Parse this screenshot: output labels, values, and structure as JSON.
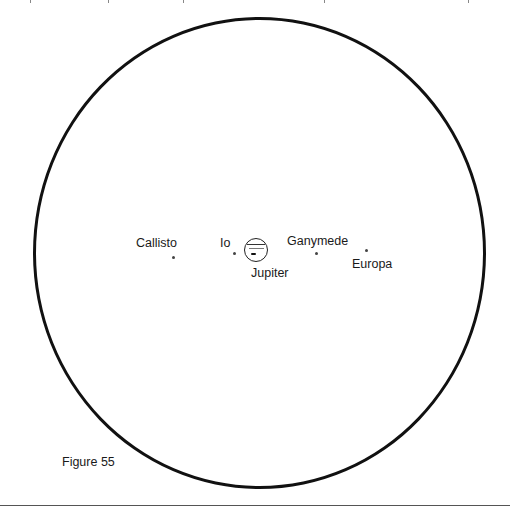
{
  "figure": {
    "caption": "Figure 55",
    "field_of_view": "circular telescope field",
    "planet": {
      "name": "Jupiter"
    },
    "moons": [
      {
        "name": "Callisto"
      },
      {
        "name": "Io"
      },
      {
        "name": "Ganymede"
      },
      {
        "name": "Europa"
      }
    ]
  }
}
